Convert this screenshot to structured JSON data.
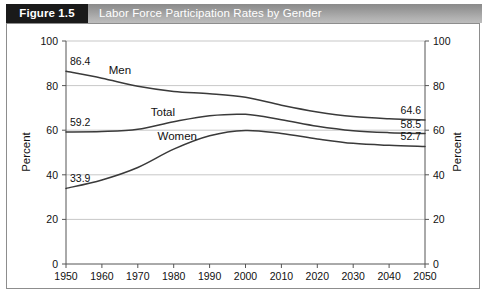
{
  "header": {
    "figure_tag": "Figure 1.5",
    "title": "Labor Force Participation Rates by Gender"
  },
  "chart_data": {
    "type": "line",
    "title": "Labor Force Participation Rates by Gender",
    "xlabel": "",
    "ylabel": "Percent",
    "ylabel_right": "Percent",
    "xlim": [
      1950,
      2050
    ],
    "ylim": [
      0,
      100
    ],
    "grid": true,
    "legend_position": "inline-labels",
    "x": [
      1950,
      1960,
      1970,
      1980,
      1990,
      2000,
      2010,
      2020,
      2030,
      2040,
      2050
    ],
    "xticks": [
      "1950",
      "1960",
      "1970",
      "1980",
      "1990",
      "2000",
      "2010",
      "2020",
      "2030",
      "2040",
      "2050"
    ],
    "yticks": [
      "0",
      "20",
      "40",
      "60",
      "80",
      "100"
    ],
    "yticks_right": [
      "0",
      "20",
      "40",
      "60",
      "80",
      "100"
    ],
    "series": [
      {
        "name": "Men",
        "label": "Men",
        "values": [
          86.4,
          83.3,
          79.7,
          77.4,
          76.4,
          74.8,
          71.2,
          68.2,
          66.1,
          65.1,
          64.6
        ],
        "start_label": "86.4",
        "end_label": "64.6"
      },
      {
        "name": "Total",
        "label": "Total",
        "values": [
          59.2,
          59.4,
          60.4,
          63.8,
          66.5,
          67.1,
          64.7,
          61.8,
          59.8,
          58.9,
          58.5
        ],
        "start_label": "59.2",
        "end_label": "58.5"
      },
      {
        "name": "Women",
        "label": "Women",
        "values": [
          33.9,
          37.7,
          43.3,
          51.5,
          57.5,
          59.9,
          58.5,
          56.1,
          54.1,
          53.2,
          52.7
        ],
        "start_label": "33.9",
        "end_label": "52.7"
      }
    ],
    "annotations": [
      {
        "text": "86.4",
        "series": "Men",
        "position": "start"
      },
      {
        "text": "64.6",
        "series": "Men",
        "position": "end"
      },
      {
        "text": "59.2",
        "series": "Total",
        "position": "start"
      },
      {
        "text": "58.5",
        "series": "Total",
        "position": "end"
      },
      {
        "text": "33.9",
        "series": "Women",
        "position": "start"
      },
      {
        "text": "52.7",
        "series": "Women",
        "position": "end"
      }
    ]
  }
}
